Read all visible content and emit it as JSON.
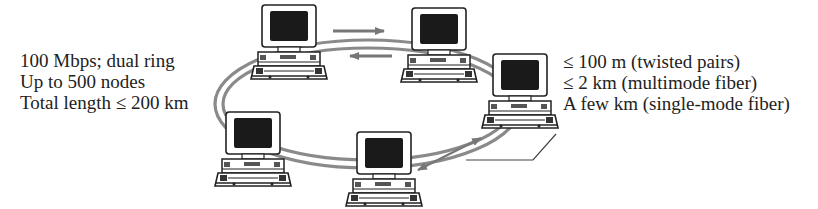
{
  "diagram": {
    "left_labels": [
      "100 Mbps; dual ring",
      "Up to 500 nodes",
      "Total length  ≤ 200 km"
    ],
    "right_labels": [
      "≤ 100 m (twisted pairs)",
      "≤ 2 km (multimode fiber)",
      "A few km (single-mode fiber)"
    ],
    "nodes": [
      {
        "id": "node-top-left",
        "x": 262,
        "y": 5
      },
      {
        "id": "node-top-right",
        "x": 412,
        "y": 8
      },
      {
        "id": "node-right",
        "x": 493,
        "y": 54
      },
      {
        "id": "node-bottom",
        "x": 357,
        "y": 132
      },
      {
        "id": "node-left",
        "x": 226,
        "y": 112
      }
    ],
    "ring": {
      "cx": 368,
      "cy": 104,
      "rx": 152,
      "ry": 62,
      "style": "dual"
    },
    "arrows": [
      {
        "name": "clockwise-arrow",
        "direction": "right"
      },
      {
        "name": "counterclockwise-arrow",
        "direction": "left"
      },
      {
        "name": "link-distance-arrow",
        "direction": "both"
      }
    ],
    "colors": {
      "ink": "#222222",
      "ring": "#8a8a8a",
      "screen": "#1a1a1a",
      "background": "#ffffff"
    }
  }
}
